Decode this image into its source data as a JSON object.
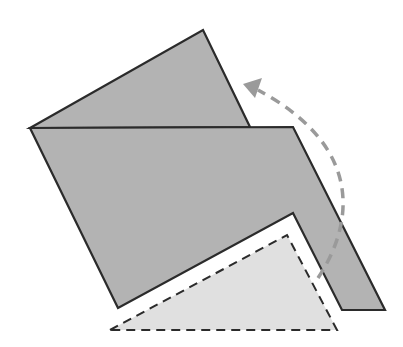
{
  "diagram": {
    "type": "origami-fold-step",
    "colors": {
      "background": "#ffffff",
      "paper_fill": "#b3b3b3",
      "outline": "#2b2b2b",
      "ghost_fill": "#e0e0e0",
      "arrow": "#9a9a9a"
    },
    "shapes": {
      "back_flap": "30,128 203,30 250,127",
      "main_body": "30,128 293,127 385,310 342,310 293,213 118,308",
      "ghost_triangle": "110,330 287,235 337,330"
    },
    "arrow": {
      "path": "M318,278 C350,230 370,150 258,90",
      "head": "243,84 262,78 255,98"
    }
  }
}
